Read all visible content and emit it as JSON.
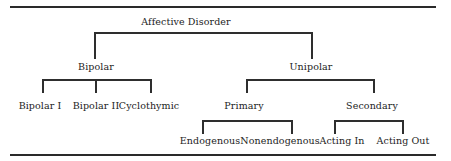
{
  "diagram": {
    "type": "taxonomy-tree",
    "root": {
      "label": "Affective Disorder",
      "children": [
        {
          "label": "Bipolar",
          "children": [
            {
              "label": "Bipolar I"
            },
            {
              "label": "Bipolar II"
            },
            {
              "label": "Cyclothymic"
            }
          ]
        },
        {
          "label": "Unipolar",
          "children": [
            {
              "label": "Primary",
              "children": [
                {
                  "label": "Endogenous"
                },
                {
                  "label": "Nonendogenous"
                }
              ]
            },
            {
              "label": "Secondary",
              "children": [
                {
                  "label": "Acting In"
                },
                {
                  "label": "Acting Out"
                }
              ]
            }
          ]
        }
      ]
    },
    "colors": {
      "line": "#2e2e2e",
      "text": "#1c1c1c",
      "background": "#ffffff"
    }
  },
  "labels": {
    "root": "Affective Disorder",
    "bipolar": "Bipolar",
    "unipolar": "Unipolar",
    "bipolar_i": "Bipolar I",
    "bipolar_ii": "Bipolar II",
    "cyclothymic": "Cyclothymic",
    "primary": "Primary",
    "secondary": "Secondary",
    "endogenous": "Endogenous",
    "nonendogenous": "Nonendogenous",
    "acting_in": "Acting In",
    "acting_out": "Acting Out"
  }
}
